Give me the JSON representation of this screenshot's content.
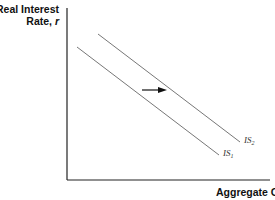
{
  "diagram": {
    "type": "IS curve shift",
    "y_axis": {
      "label_line1": "Real Interest",
      "label_line2": "Rate, ",
      "variable": "r"
    },
    "x_axis": {
      "label": "Aggregate Output, Y"
    },
    "curves": [
      {
        "name": "IS",
        "subscript": "1",
        "x1": 77,
        "y1": 47,
        "x2": 219,
        "y2": 155
      },
      {
        "name": "IS",
        "subscript": "2",
        "x1": 98,
        "y1": 34,
        "x2": 240,
        "y2": 142
      }
    ],
    "arrow": {
      "direction": "right",
      "meaning": "rightward shift of IS curve"
    },
    "colors": {
      "axis": "#222222",
      "curve": "#777777",
      "arrow": "#111111",
      "text": "#111111"
    }
  }
}
